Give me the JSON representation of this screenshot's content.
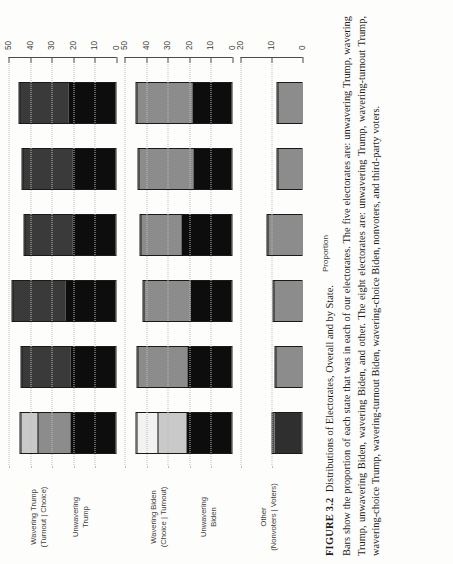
{
  "figure": {
    "number": "FIGURE 3.2",
    "title": "Distributions of Electorates, Overall and by State.",
    "body": "Bars show the proportion of each state that was in each of our electorates. The five electorates are: unwavering Trump, wavering Trump, unwavering Biden, wavering Biden, and other. The eight electorates are: unwavering Trump, wavering-turnout Trump, wavering-choice Trump, wavering-turnout Biden, wavering-choice Biden, nonvoters, and third-party voters."
  },
  "panels": {
    "trump": {
      "line1": "Unwavering",
      "line2": "Trump"
    },
    "trump_wav": {
      "line1": "Wavering Trump",
      "line2": "(Turnout | Choice)"
    },
    "biden_wav": {
      "line1": "Wavering Biden",
      "line2": "(Choice | Turnout)"
    },
    "biden": {
      "line1": "Unwavering",
      "line2": "Biden"
    },
    "other": {
      "line1": "Other",
      "line2": "(Nonvoters | Voters)"
    }
  },
  "axis": {
    "title": "Proportion",
    "bottom_ticks": [
      "0",
      "10",
      "20",
      "30",
      "40",
      "50"
    ],
    "middle_ticks": [
      "0",
      "10",
      "20",
      "30",
      "40",
      "50"
    ],
    "top_ticks": [
      "0",
      "10",
      "20"
    ]
  },
  "categories": [
    "All–8",
    "All–5",
    "FL",
    "PA",
    "MI",
    "WI"
  ],
  "colors": {
    "unwavering": "#0d0d0d",
    "wavering_dark": "#3a3a3a",
    "wavering_mid": "#8c8c8c",
    "wavering_light": "#c9c9c9",
    "wavering_pale": "#f2f2f2",
    "other_grey": "#8c8c8c",
    "other_dark": "#2f2f2f",
    "outline": "#1a1a1a",
    "axis": "#4b4b4b",
    "grid": "#bdbdbd",
    "background": "#fdfdfb"
  },
  "chart_data": {
    "type": "bar",
    "title": "Distributions of Electorates, Overall and by State.",
    "xlabel": "",
    "ylabel": "Proportion",
    "grid": true,
    "legend": "none",
    "orientation": "vertical-stacked, three faceted panels",
    "categories": [
      "All–8",
      "All–5",
      "FL",
      "PA",
      "MI",
      "WI"
    ],
    "panels": [
      {
        "name": "Trump",
        "strip_labels": [
          "Unwavering Trump",
          "Wavering Trump (Turnout | Choice)"
        ],
        "ylim": [
          0,
          50
        ],
        "yticks": [
          0,
          10,
          20,
          30,
          40,
          50
        ],
        "series": [
          {
            "name": "Unwavering Trump",
            "color": "#0d0d0d",
            "values": [
              21.5,
              21.5,
              23.5,
              20.5,
              20.5,
              22.0
            ]
          },
          {
            "name": "Wavering-turnout Trump",
            "color": "#8c8c8c",
            "values": [
              15.5,
              0,
              0,
              0,
              0,
              0
            ]
          },
          {
            "name": "Wavering-choice Trump",
            "color": "#c9c9c9",
            "values": [
              8.0,
              0,
              0,
              0,
              0,
              0
            ]
          },
          {
            "name": "Wavering Trump (combined, 5-electorate)",
            "color": "#3a3a3a",
            "values": [
              0,
              23.0,
              25.0,
              22.5,
              23.5,
              23.5
            ]
          }
        ],
        "totals": [
          45.0,
          44.5,
          48.5,
          43.0,
          44.0,
          45.5
        ]
      },
      {
        "name": "Biden",
        "strip_labels": [
          "Wavering Biden (Choice | Turnout)",
          "Unwavering Biden"
        ],
        "ylim": [
          0,
          50
        ],
        "yticks": [
          0,
          10,
          20,
          30,
          40,
          50
        ],
        "series": [
          {
            "name": "Unwavering Biden",
            "color": "#0d0d0d",
            "values": [
              21.5,
              21.0,
              19.5,
              23.5,
              18.0,
              18.5
            ]
          },
          {
            "name": "Wavering-choice Biden",
            "color": "#c9c9c9",
            "values": [
              13.5,
              0,
              0,
              0,
              0,
              0
            ]
          },
          {
            "name": "Wavering-turnout Biden",
            "color": "#f2f2f2",
            "values": [
              10.0,
              0,
              0,
              0,
              0,
              0
            ]
          },
          {
            "name": "Wavering Biden (combined, 5-electorate)",
            "color": "#8c8c8c",
            "values": [
              0,
              23.5,
              22.0,
              19.5,
              26.0,
              26.5
            ]
          }
        ],
        "totals": [
          45.0,
          44.5,
          41.5,
          43.0,
          44.0,
          45.0
        ]
      },
      {
        "name": "Other",
        "strip_labels": [
          "Other (Nonvoters | Voters)"
        ],
        "ylim": [
          0,
          20
        ],
        "yticks": [
          0,
          10,
          20
        ],
        "series": [
          {
            "name": "Nonvoters",
            "color": "#2f2f2f",
            "values": [
              9.3,
              0,
              0,
              0,
              0,
              0
            ]
          },
          {
            "name": "Third-party voters",
            "color": "#8c8c8c",
            "values": [
              0.7,
              0,
              0,
              0,
              0,
              0
            ]
          },
          {
            "name": "Other (combined, 5-electorate)",
            "color": "#8c8c8c",
            "values": [
              0,
              9.0,
              9.8,
              11.5,
              8.4,
              8.4
            ]
          }
        ],
        "totals": [
          10.0,
          9.0,
          9.8,
          11.5,
          8.4,
          8.4
        ]
      }
    ]
  }
}
